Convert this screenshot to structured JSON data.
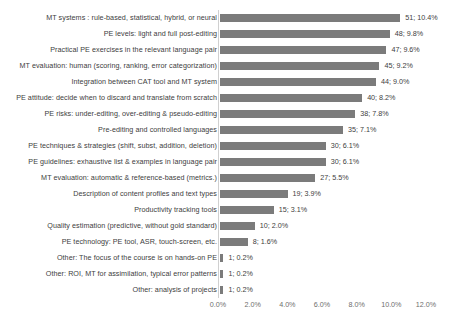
{
  "chart_data": {
    "type": "bar",
    "orientation": "horizontal",
    "title": "",
    "xlabel": "",
    "ylabel": "",
    "xlim": [
      0,
      12
    ],
    "xticks": [
      "0.0%",
      "2.0%",
      "4.0%",
      "6.0%",
      "8.0%",
      "10.0%",
      "12.0%"
    ],
    "xtick_values": [
      0,
      2,
      4,
      6,
      8,
      10,
      12
    ],
    "grid": false,
    "legend": false,
    "bar_color": "#7b7b7b",
    "categories": [
      "MT systems : rule-based, statistical, hybrid, or neural",
      "PE levels: light and full post-editing",
      "Practical PE exercises in the relevant language pair",
      "MT evaluation: human (scoring, ranking, error categorization)",
      "Integration between CAT tool and MT system",
      "PE attitude: decide when to discard and translate from scratch",
      "PE risks: under-editing, over-editing & pseudo-editing",
      "Pre-editing and controlled languages",
      "PE techniques & strategies (shift, subst, addition, deletion)",
      "PE guidelines: exhaustive list & examples in language pair",
      "MT evaluation: automatic & reference-based (metrics.)",
      "Description of content profiles and text types",
      "Productivity tracking tools",
      "Quality estimation (predictive, without gold standard)",
      "PE technology: PE tool, ASR, touch-screen, etc.",
      "Other: The focus of the course is on hands-on PE",
      "Other: ROI, MT for assimilation, typical error patterns",
      "Other: analysis of projects"
    ],
    "counts": [
      51,
      48,
      47,
      45,
      44,
      40,
      38,
      35,
      30,
      30,
      27,
      19,
      15,
      10,
      8,
      1,
      1,
      1
    ],
    "values": [
      10.4,
      9.8,
      9.6,
      9.2,
      9.0,
      8.2,
      7.8,
      7.1,
      6.1,
      6.1,
      5.5,
      3.9,
      3.1,
      2.0,
      1.6,
      0.2,
      0.2,
      0.2
    ],
    "data_labels": [
      "51; 10.4%",
      "48; 9.8%",
      "47; 9.6%",
      "45; 9.2%",
      "44; 9.0%",
      "40; 8.2%",
      "38; 7.8%",
      "35; 7.1%",
      "30; 6.1%",
      "30; 6.1%",
      "27; 5.5%",
      "19; 3.9%",
      "15; 3.1%",
      "10; 2.0%",
      "8; 1.6%",
      "1; 0.2%",
      "1; 0.2%",
      "1; 0.2%"
    ]
  }
}
